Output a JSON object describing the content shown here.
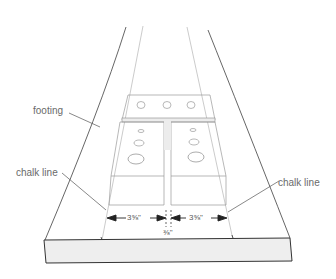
{
  "diagram": {
    "type": "technical-illustration",
    "labels": {
      "footing": "footing",
      "chalk_line_left": "chalk line",
      "chalk_line_right": "chalk line"
    },
    "dimensions": {
      "left_width": "3⅝\"",
      "right_width": "3⅝\"",
      "gap": "⅜\""
    },
    "colors": {
      "line": "#444444",
      "light_line": "#9a9a9a",
      "footing_face": "#f0f0f0",
      "text": "#6a6a6a"
    }
  }
}
